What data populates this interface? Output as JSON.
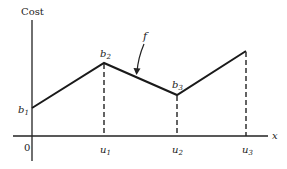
{
  "diagram": {
    "y_axis_label": "Cost",
    "x_axis_label": "x",
    "origin_label": "0",
    "function_label": "f",
    "points": [
      {
        "label": "b",
        "sub": "1",
        "x": 32,
        "y": 108
      },
      {
        "label": "b",
        "sub": "2",
        "x": 104,
        "y": 63
      },
      {
        "label": "b",
        "sub": "3",
        "x": 177,
        "y": 95
      },
      {
        "label": "",
        "sub": "",
        "x": 246,
        "y": 51
      }
    ],
    "x_ticks": [
      {
        "label": "u",
        "sub": "1",
        "x": 104
      },
      {
        "label": "u",
        "sub": "2",
        "x": 177
      },
      {
        "label": "u",
        "sub": "3",
        "x": 246
      }
    ],
    "colors": {
      "ink": "#222222",
      "background": "#ffffff"
    }
  }
}
